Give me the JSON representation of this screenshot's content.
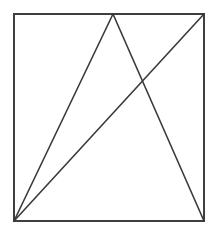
{
  "figure": {
    "type": "geometric-line-drawing",
    "canvas": {
      "width": 217,
      "height": 229
    },
    "background_color": "#ffffff",
    "stroke_color": "#3a3a3a",
    "square_stroke_color": "#3f3f3f",
    "stroke_width": 1.6,
    "square_stroke_width": 2,
    "points": {
      "top_left": {
        "x": 14,
        "y": 14
      },
      "top_right": {
        "x": 204,
        "y": 14
      },
      "bottom_right": {
        "x": 204,
        "y": 221
      },
      "bottom_left": {
        "x": 14,
        "y": 221
      },
      "apex": {
        "x": 113,
        "y": 14
      },
      "crossing": {
        "x": 142,
        "y": 85
      }
    },
    "shapes": {
      "square": {
        "name": "outer-square",
        "path": "M 14 14 L 204 14 L 204 221 L 14 221 Z"
      },
      "triangle_left_leg": {
        "name": "triangle-left-leg",
        "x1": 14,
        "y1": 221,
        "x2": 113,
        "y2": 14
      },
      "triangle_right_leg": {
        "name": "triangle-right-leg",
        "x1": 113,
        "y1": 14,
        "x2": 204,
        "y2": 221
      },
      "diagonal": {
        "name": "corner-diagonal",
        "x1": 14,
        "y1": 221,
        "x2": 204,
        "y2": 14
      }
    }
  }
}
